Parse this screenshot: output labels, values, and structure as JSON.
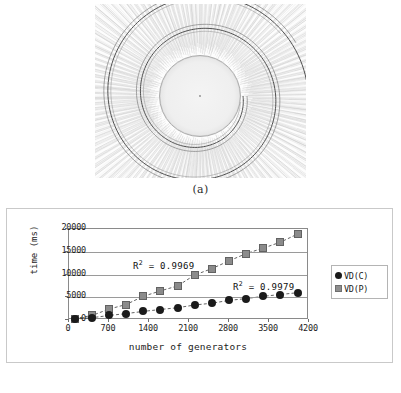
{
  "figure_a": {
    "caption": "(a)",
    "description": "voronoi-diagram-spiral-generators"
  },
  "figure_b": {
    "caption": "(b)"
  },
  "chart_data": {
    "type": "scatter",
    "title": "",
    "xlabel": "number of generators",
    "ylabel": "time (ms)",
    "xlim": [
      0,
      4200
    ],
    "ylim": [
      0,
      20000
    ],
    "xticks": [
      "0",
      "700",
      "1400",
      "2100",
      "2800",
      "3500",
      "4200"
    ],
    "xtick_values": [
      0,
      700,
      1400,
      2100,
      2800,
      3500,
      4200
    ],
    "yticks": [
      "0",
      "5000",
      "10000",
      "15000",
      "20000"
    ],
    "ytick_values": [
      0,
      5000,
      10000,
      15000,
      20000
    ],
    "grid": "horizontal",
    "legend_position": "right",
    "x": [
      100,
      400,
      700,
      1000,
      1300,
      1600,
      1900,
      2200,
      2500,
      2800,
      3100,
      3400,
      3700,
      4000
    ],
    "series": [
      {
        "name": "VD(C)",
        "marker": "circle",
        "color": "#1b1b1b",
        "r2_label": "0.9979",
        "values": [
          200,
          500,
          1000,
          1400,
          1900,
          2300,
          2700,
          3300,
          3700,
          4300,
          4700,
          5200,
          5600,
          6000
        ]
      },
      {
        "name": "VD(P)",
        "marker": "square",
        "color": "#8b8b8b",
        "r2_label": "0.9969",
        "values": [
          300,
          1000,
          2400,
          3400,
          5200,
          6400,
          7500,
          9900,
          11300,
          13000,
          14600,
          15800,
          17100,
          18900
        ]
      }
    ],
    "annotations": [
      {
        "id": "r2-p",
        "prefix": "R",
        "sup": "2",
        "text": " = 0.9969"
      },
      {
        "id": "r2-c",
        "prefix": "R",
        "sup": "2",
        "text": " = 0.9979"
      }
    ],
    "legend": [
      {
        "label": "VD(C)",
        "marker": "circle"
      },
      {
        "label": "VD(P)",
        "marker": "square"
      }
    ]
  }
}
